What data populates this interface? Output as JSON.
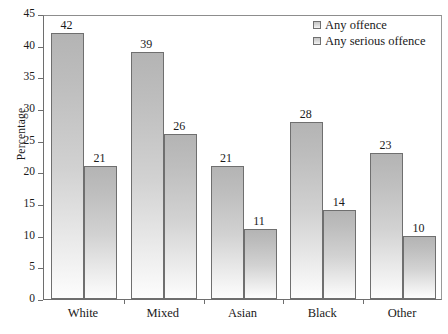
{
  "chart_data": {
    "type": "bar",
    "title": "",
    "xlabel": "",
    "ylabel": "Percentage",
    "ylim": [
      0,
      45
    ],
    "yticks": [
      0,
      5,
      10,
      15,
      20,
      25,
      30,
      35,
      40,
      45
    ],
    "grid": false,
    "legend_position": "top-right",
    "categories": [
      "White",
      "Mixed",
      "Asian",
      "Black",
      "Other"
    ],
    "series": [
      {
        "name": "Any offence",
        "values": [
          42,
          39,
          21,
          28,
          23
        ]
      },
      {
        "name": "Any serious offence",
        "values": [
          21,
          26,
          11,
          14,
          10
        ]
      }
    ],
    "bar_labels": [
      [
        "42",
        "21"
      ],
      [
        "39",
        "26"
      ],
      [
        "21",
        "11"
      ],
      [
        "28",
        "14"
      ],
      [
        "23",
        "10"
      ]
    ],
    "ytick_labels": [
      "45",
      "40",
      "35",
      "30",
      "25",
      "20",
      "15",
      "10",
      "5",
      "0"
    ],
    "colors": {
      "bar_top": "#b4b4b4",
      "bar_bottom": "#fdfdfd",
      "bar_border": "#6f6f6f",
      "axis": "#6e6e6e",
      "text": "#1a1a1a",
      "background": "#ffffff"
    }
  },
  "axis": {
    "y_title": "Percentage",
    "ticks": [
      {
        "value": "45"
      },
      {
        "value": "40"
      },
      {
        "value": "35"
      },
      {
        "value": "30"
      },
      {
        "value": "25"
      },
      {
        "value": "20"
      },
      {
        "value": "15"
      },
      {
        "value": "10"
      },
      {
        "value": "5"
      },
      {
        "value": "0"
      }
    ],
    "categories": [
      {
        "label": "White"
      },
      {
        "label": "Mixed"
      },
      {
        "label": "Asian"
      },
      {
        "label": "Black"
      },
      {
        "label": "Other"
      }
    ]
  },
  "legend": {
    "entries": [
      {
        "label": "Any offence"
      },
      {
        "label": "Any serious offence"
      }
    ]
  },
  "caption": {
    "partial_text": ""
  }
}
